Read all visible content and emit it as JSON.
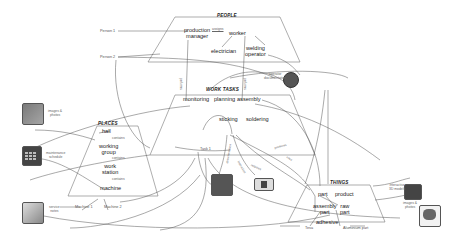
{
  "diagram": {
    "people": {
      "title": "PEOPLE",
      "nodes": {
        "production_manager": "production\nmanager",
        "worker": "worker",
        "electrician": "electrician",
        "welding_operator": "welding\noperator"
      },
      "edge_label": "assigns"
    },
    "work_tasks": {
      "title": "WORK TASKS",
      "nodes": {
        "monitoring": "monitoring",
        "planning": "planning",
        "assembly": "assembly",
        "sticking": "sticking",
        "soldering": "soldering"
      }
    },
    "places": {
      "title": "PLACES",
      "nodes": {
        "hall": "hall",
        "working_group": "working\ngroup",
        "work_station": "work\nstation",
        "machine": "machine"
      },
      "edge_labels": [
        "contains",
        "contains",
        "contains"
      ]
    },
    "things": {
      "title": "THINGS",
      "nodes": {
        "part": "part",
        "product": "product",
        "assembly_part": "assembly\npart",
        "raw_part": "raw\npart",
        "adhesive": "adhesive"
      }
    },
    "instances": {
      "person1": "Person 1",
      "person2": "Person 2",
      "task1": "Task 1",
      "machine1": "Machine 1",
      "machine2": "Machine 2",
      "tesa": "Tesa",
      "aluminium_part": "Aluminium part"
    },
    "media": {
      "images_photos_left": "images &\nphotos",
      "maintenance_schedule": "maintenance\nschedule",
      "service_notes": "service\nnotes",
      "operator_documentation": "operator\ndocumentation",
      "interactive_3d_models": "interactive\n3D models",
      "images_photos_right": "images &\nphotos"
    },
    "connection_labels": {
      "performs": "performs",
      "produces": "produces",
      "uses": "uses",
      "requires": "requires",
      "documentation": "documentation",
      "instruction": "instruction"
    }
  }
}
